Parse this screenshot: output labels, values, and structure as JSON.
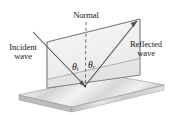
{
  "figure": {
    "width": 171,
    "height": 115,
    "background_color": "#ffffff"
  },
  "labels": {
    "normal": "Normal",
    "incident_wave_line1": "Incident",
    "incident_wave_line2": "wave",
    "reflected_wave_line1": "Reflected",
    "reflected_wave_line2": "wave",
    "theta_incident_symbol": "θ",
    "theta_incident_subscript": "i",
    "theta_reflected_symbol": "θ",
    "theta_reflected_subscript": "r"
  },
  "colors": {
    "line": "#4a4a4a",
    "ray": "#555555",
    "dashed_normal": "#6b6b6b",
    "plane_fill": "#f2f2f2",
    "slab_top_fill": "#e2e2e2",
    "slab_side_fill": "#cfcfcf",
    "slab_front_fill": "#d9d9d9",
    "text": "#1a1a1a"
  },
  "geometry": {
    "reflection_point": {
      "x": 85,
      "y": 86
    },
    "normal_top": {
      "x": 86,
      "y": 22
    },
    "incident_ray_start": {
      "x": 33,
      "y": 32
    },
    "reflected_ray_end": {
      "x": 137,
      "y": 21
    },
    "vertical_plane_corners": [
      {
        "x": 47,
        "y": 42
      },
      {
        "x": 140,
        "y": 19
      },
      {
        "x": 140,
        "y": 75
      },
      {
        "x": 47,
        "y": 88
      }
    ],
    "slab_top_corners": [
      {
        "x": 19,
        "y": 95
      },
      {
        "x": 109,
        "y": 75
      },
      {
        "x": 164,
        "y": 85
      },
      {
        "x": 72,
        "y": 107
      }
    ]
  }
}
